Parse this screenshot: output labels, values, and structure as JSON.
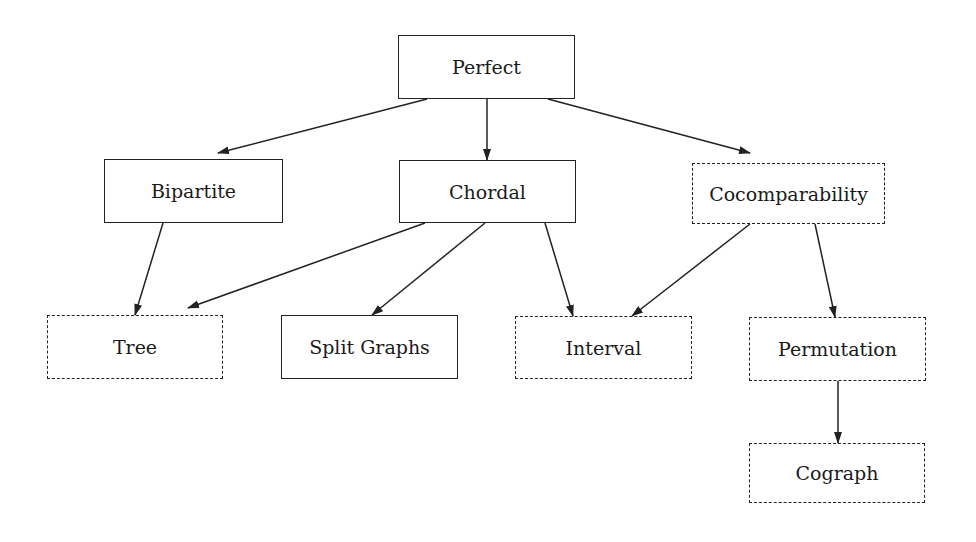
{
  "diagram": {
    "type": "hierarchy",
    "nodes": [
      {
        "id": "perfect",
        "label": "Perfect",
        "style": "solid",
        "x": 398,
        "y": 35,
        "w": 177,
        "h": 64
      },
      {
        "id": "bipartite",
        "label": "Bipartite",
        "style": "solid",
        "x": 104,
        "y": 159,
        "w": 179,
        "h": 64
      },
      {
        "id": "chordal",
        "label": "Chordal",
        "style": "solid",
        "x": 399,
        "y": 160,
        "w": 177,
        "h": 63
      },
      {
        "id": "cocomparability",
        "label": "Cocomparability",
        "style": "dashed",
        "x": 692,
        "y": 163,
        "w": 193,
        "h": 61
      },
      {
        "id": "tree",
        "label": "Tree",
        "style": "dashed",
        "x": 47,
        "y": 315,
        "w": 176,
        "h": 64
      },
      {
        "id": "split",
        "label": "Split Graphs",
        "style": "solid",
        "x": 281,
        "y": 315,
        "w": 177,
        "h": 64
      },
      {
        "id": "interval",
        "label": "Interval",
        "style": "dashed",
        "x": 515,
        "y": 316,
        "w": 177,
        "h": 63
      },
      {
        "id": "permutation",
        "label": "Permutation",
        "style": "dashed",
        "x": 749,
        "y": 317,
        "w": 177,
        "h": 64
      },
      {
        "id": "cograph",
        "label": "Cograph",
        "style": "dashed",
        "x": 749,
        "y": 443,
        "w": 176,
        "h": 60
      }
    ],
    "edges": [
      {
        "from": "perfect",
        "to": "bipartite",
        "x1": 427,
        "y1": 99,
        "x2": 218,
        "y2": 153
      },
      {
        "from": "perfect",
        "to": "chordal",
        "x1": 487,
        "y1": 99,
        "x2": 487,
        "y2": 160
      },
      {
        "from": "perfect",
        "to": "cocomparability",
        "x1": 548,
        "y1": 99,
        "x2": 750,
        "y2": 153
      },
      {
        "from": "bipartite",
        "to": "tree",
        "x1": 163,
        "y1": 223,
        "x2": 135,
        "y2": 315
      },
      {
        "from": "chordal",
        "to": "tree",
        "x1": 425,
        "y1": 223,
        "x2": 188,
        "y2": 308
      },
      {
        "from": "chordal",
        "to": "split",
        "x1": 485,
        "y1": 223,
        "x2": 372,
        "y2": 315
      },
      {
        "from": "chordal",
        "to": "interval",
        "x1": 545,
        "y1": 223,
        "x2": 573,
        "y2": 316
      },
      {
        "from": "cocomparability",
        "to": "interval",
        "x1": 750,
        "y1": 224,
        "x2": 632,
        "y2": 316
      },
      {
        "from": "cocomparability",
        "to": "permutation",
        "x1": 815,
        "y1": 224,
        "x2": 835,
        "y2": 317
      },
      {
        "from": "permutation",
        "to": "cograph",
        "x1": 838,
        "y1": 381,
        "x2": 838,
        "y2": 443
      }
    ],
    "legend_styles": {
      "solid": "solid border box",
      "dashed": "dashed border box"
    },
    "colors": {
      "line": "#222222",
      "text": "#1a1a1a",
      "background": "#ffffff"
    }
  }
}
